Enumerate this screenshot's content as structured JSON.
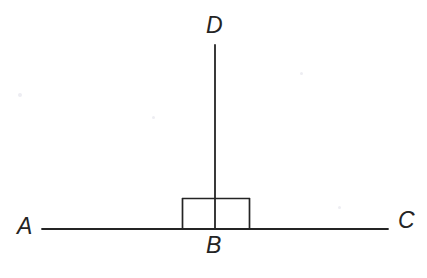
{
  "figure": {
    "kind": "geometry-diagram",
    "width": 427,
    "height": 278,
    "background_color": "#ffffff",
    "stroke_color": "#242424",
    "stroke_width": 1.8
  },
  "labels": {
    "a": "A",
    "b": "B",
    "c": "C",
    "d": "D"
  },
  "points": {
    "A": {
      "x": 42,
      "y": 229
    },
    "B": {
      "x": 215,
      "y": 229
    },
    "C": {
      "x": 388,
      "y": 229
    },
    "D": {
      "x": 215,
      "y": 45
    }
  },
  "segments": [
    {
      "name": "line-AC",
      "x1": 42,
      "y1": 229,
      "x2": 388,
      "y2": 229
    },
    {
      "name": "ray-BD",
      "x1": 215,
      "y1": 229,
      "x2": 215,
      "y2": 45
    }
  ],
  "right_angle_marker": {
    "name": "right-angle-box",
    "left": 182,
    "right": 250,
    "top": 198,
    "bottom": 229,
    "open_bottom": true,
    "angle_degrees": 90
  }
}
